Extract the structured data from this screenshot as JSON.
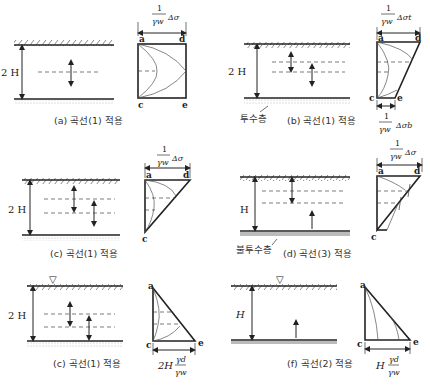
{
  "panels": [
    {
      "id": "a",
      "caption": "(a) 곡선(1) 적용",
      "depth_label": "2 H",
      "top_width_label_num": "1",
      "top_width_label_den": "γw",
      "top_width_label_sym": "Δσ",
      "points": {
        "a": "a",
        "c": "c",
        "d": "d",
        "e": "e"
      },
      "top_boundary": "permeable",
      "bottom_boundary": "permeable"
    },
    {
      "id": "b",
      "caption": "(b) 곡선(1) 적용",
      "depth_label": "2 H",
      "layer_label": "투수층",
      "top_width_label_num": "1",
      "top_width_label_den": "γw",
      "top_width_label_sym": "Δσt",
      "bottom_width_label_num": "1",
      "bottom_width_label_den": "γw",
      "bottom_width_label_sym": "Δσb",
      "points": {
        "a": "a",
        "c": "c",
        "d": "d",
        "e": "e"
      }
    },
    {
      "id": "c",
      "caption": "(c) 곡선(1) 적용",
      "depth_label": "2 H",
      "top_width_label_num": "1",
      "top_width_label_den": "γw",
      "top_width_label_sym": "Δσ",
      "points": {
        "a": "a",
        "c": "c",
        "d": "d"
      }
    },
    {
      "id": "d",
      "caption": "(d) 곡선(3) 적용",
      "depth_label": "H",
      "layer_label": "불투수층",
      "top_width_label_num": "1",
      "top_width_label_den": "γw",
      "top_width_label_sym": "Δσ",
      "points": {
        "a": "a",
        "c": "c",
        "d": "d"
      }
    },
    {
      "id": "e",
      "caption": "(c) 곡선(1) 적용",
      "depth_label": "2 H",
      "water_table": "▽",
      "bottom_width_label_pre": "2H",
      "bottom_width_label_num": "γd",
      "bottom_width_label_den": "γw",
      "points": {
        "a": "a",
        "c": "c",
        "e": "e"
      }
    },
    {
      "id": "f",
      "caption": "(f) 곡선(2) 적용",
      "depth_label": "H",
      "water_table": "▽",
      "bottom_width_label_pre": "H",
      "bottom_width_label_num": "γd",
      "bottom_width_label_den": "γw",
      "points": {
        "a": "a",
        "c": "c",
        "e": "e"
      }
    }
  ]
}
